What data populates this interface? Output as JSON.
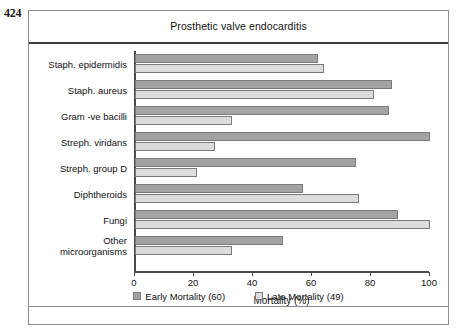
{
  "page_number": "424",
  "chart_data": {
    "type": "bar",
    "orientation": "horizontal",
    "title": "Prosthetic valve endocarditis",
    "xlabel": "Mortality (%)",
    "ylabel": "",
    "xlim": [
      0,
      100
    ],
    "xticks": [
      0,
      20,
      40,
      60,
      80,
      100
    ],
    "xtick_labels": [
      "0",
      "20",
      "40",
      "60",
      "80",
      "100"
    ],
    "grid": false,
    "legend_position": "bottom",
    "categories": [
      "Staph. epidermidis",
      "Staph. aureus",
      "Gram -ve bacilli",
      "Streph. viridans",
      "Streph. group D",
      "Diphtheroids",
      "Fungi",
      "Other\nmicroorganisms"
    ],
    "series": [
      {
        "name": "Early Mortality (60)",
        "color": "#a3a3a3",
        "values": [
          62,
          87,
          86,
          100,
          75,
          57,
          89,
          50
        ]
      },
      {
        "name": "Late Mortality (49)",
        "color": "#dcdcdc",
        "values": [
          64,
          81,
          33,
          27,
          21,
          76,
          100,
          33
        ]
      }
    ]
  }
}
